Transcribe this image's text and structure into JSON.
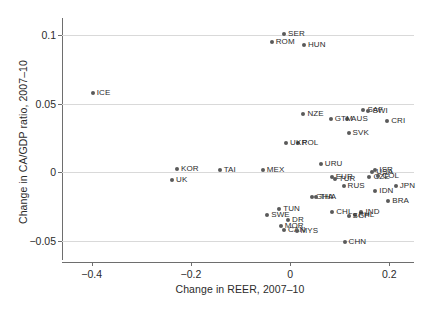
{
  "chart_data": {
    "type": "scatter",
    "title": "",
    "xlabel": "Change in REER, 2007–10",
    "ylabel": "Change in CA/GDP ratio, 2007–10",
    "xlim": [
      -0.46,
      0.25
    ],
    "ylim": [
      -0.062,
      0.112
    ],
    "xticks": [
      -0.4,
      -0.2,
      0,
      0.2
    ],
    "xticklabels": [
      "−0.4",
      "−0.2",
      "0",
      "0.2"
    ],
    "yticks": [
      -0.05,
      0,
      0.05,
      0.1
    ],
    "yticklabels": [
      "−0.05",
      "0",
      "0.05",
      "0.1"
    ],
    "grid": "horizontal",
    "legend": "none",
    "marker_color": "#5a5a5a",
    "grid_color": "#d9d9d9",
    "axis_color": "#6e6e6e",
    "points": [
      {
        "label": "ICE",
        "x": -0.398,
        "y": 0.0575,
        "side": "right"
      },
      {
        "label": "SER",
        "x": -0.012,
        "y": 0.1005,
        "side": "right"
      },
      {
        "label": "ROM",
        "x": -0.037,
        "y": 0.0945,
        "side": "right"
      },
      {
        "label": "HUN",
        "x": 0.028,
        "y": 0.0925,
        "side": "right"
      },
      {
        "label": "SAF",
        "x": 0.148,
        "y": 0.0455,
        "side": "right"
      },
      {
        "label": "SWI",
        "x": 0.158,
        "y": 0.0445,
        "side": "right"
      },
      {
        "label": "CRI",
        "x": 0.196,
        "y": 0.0375,
        "side": "right"
      },
      {
        "label": "AUS",
        "x": 0.115,
        "y": 0.0385,
        "side": "right"
      },
      {
        "label": "GTM",
        "x": 0.082,
        "y": 0.0385,
        "side": "right"
      },
      {
        "label": "NZE",
        "x": 0.027,
        "y": 0.0425,
        "side": "right"
      },
      {
        "label": "SVK",
        "x": 0.118,
        "y": 0.0285,
        "side": "right"
      },
      {
        "label": "POL",
        "x": 0.016,
        "y": 0.0215,
        "side": "right"
      },
      {
        "label": "UKR",
        "x": -0.008,
        "y": 0.0215,
        "side": "right"
      },
      {
        "label": "URU",
        "x": 0.062,
        "y": 0.0065,
        "side": "right"
      },
      {
        "label": "KOR",
        "x": -0.228,
        "y": 0.0025,
        "side": "right"
      },
      {
        "label": "TAI",
        "x": -0.142,
        "y": 0.0015,
        "side": "right"
      },
      {
        "label": "MEX",
        "x": -0.055,
        "y": 0.0015,
        "side": "right"
      },
      {
        "label": "UK",
        "x": -0.238,
        "y": -0.0055,
        "side": "right"
      },
      {
        "label": "USA",
        "x": 0.166,
        "y": 0.0005,
        "side": "right"
      },
      {
        "label": "ISR",
        "x": 0.172,
        "y": 0.0015,
        "side": "right"
      },
      {
        "label": "CZE",
        "x": 0.16,
        "y": -0.0035,
        "side": "right"
      },
      {
        "label": "COL",
        "x": 0.178,
        "y": -0.0025,
        "side": "right"
      },
      {
        "label": "EUR",
        "x": 0.084,
        "y": -0.0035,
        "side": "right"
      },
      {
        "label": "TUR",
        "x": 0.09,
        "y": -0.0045,
        "side": "right"
      },
      {
        "label": "RUS",
        "x": 0.108,
        "y": -0.0095,
        "side": "right"
      },
      {
        "label": "JPN",
        "x": 0.213,
        "y": -0.0095,
        "side": "right"
      },
      {
        "label": "IDN",
        "x": 0.172,
        "y": -0.0135,
        "side": "right"
      },
      {
        "label": "GHA",
        "x": 0.044,
        "y": -0.0175,
        "side": "right"
      },
      {
        "label": "THA",
        "x": 0.052,
        "y": -0.0175,
        "side": "right"
      },
      {
        "label": "BRA",
        "x": 0.198,
        "y": -0.0205,
        "side": "right"
      },
      {
        "label": "TUN",
        "x": -0.022,
        "y": -0.0265,
        "side": "right"
      },
      {
        "label": "CHL",
        "x": 0.085,
        "y": -0.0285,
        "side": "right"
      },
      {
        "label": "IND",
        "x": 0.144,
        "y": -0.0285,
        "side": "right"
      },
      {
        "label": "PHL",
        "x": 0.13,
        "y": -0.0305,
        "side": "right"
      },
      {
        "label": "SGP",
        "x": 0.118,
        "y": -0.0315,
        "side": "right"
      },
      {
        "label": "SWE",
        "x": -0.046,
        "y": -0.0305,
        "side": "right"
      },
      {
        "label": "DR",
        "x": -0.004,
        "y": -0.0345,
        "side": "right"
      },
      {
        "label": "MOR",
        "x": -0.019,
        "y": -0.0385,
        "side": "right"
      },
      {
        "label": "CAN",
        "x": -0.012,
        "y": -0.0415,
        "side": "right"
      },
      {
        "label": "MYS",
        "x": 0.013,
        "y": -0.0425,
        "side": "right"
      },
      {
        "label": "CHN",
        "x": 0.11,
        "y": -0.0505,
        "side": "right"
      }
    ]
  }
}
